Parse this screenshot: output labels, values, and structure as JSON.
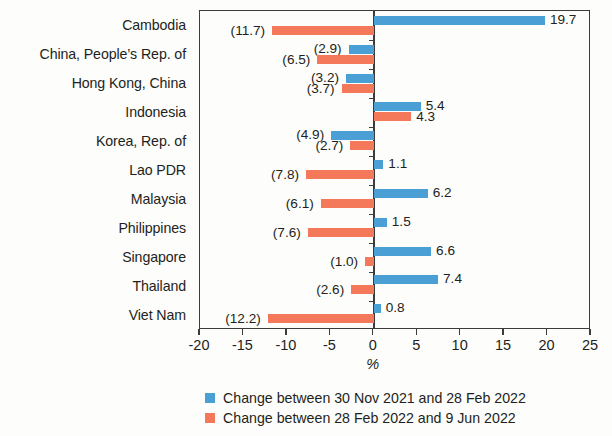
{
  "chart_data": {
    "type": "bar",
    "orientation": "horizontal",
    "title": "",
    "subtitle": "",
    "xlabel": "%",
    "ylabel": "",
    "xlim": [
      -20,
      25
    ],
    "xticks": [
      "-20",
      "-15",
      "-10",
      "-5",
      "0",
      "5",
      "10",
      "15",
      "20",
      "25"
    ],
    "xtick_values": [
      -20,
      -15,
      -10,
      -5,
      0,
      5,
      10,
      15,
      20,
      25
    ],
    "grid": false,
    "legend_position": "bottom",
    "negative_label_format": "parentheses",
    "categories": [
      "Cambodia",
      "China, People’s Rep. of",
      "Hong Kong, China",
      "Indonesia",
      "Korea, Rep. of",
      "Lao PDR",
      "Malaysia",
      "Philippines",
      "Singapore",
      "Thailand",
      "Viet Nam"
    ],
    "series": [
      {
        "name": "Change between 30 Nov 2021 and 28 Feb 2022",
        "color": "#4a9fd4",
        "values": [
          19.7,
          -2.9,
          -3.2,
          5.4,
          -4.9,
          1.1,
          6.2,
          1.5,
          6.6,
          7.4,
          0.8
        ],
        "labels": [
          "19.7",
          "(2.9)",
          "(3.2)",
          "5.4",
          "(4.9)",
          "1.1",
          "6.2",
          "1.5",
          "6.6",
          "7.4",
          "0.8"
        ]
      },
      {
        "name": "Change between 28 Feb 2022 and 9 Jun 2022",
        "color": "#f4795a",
        "values": [
          -11.7,
          -6.5,
          -3.7,
          4.3,
          -2.7,
          -7.8,
          -6.1,
          -7.6,
          -1.0,
          -2.6,
          -12.2
        ],
        "labels": [
          "(11.7)",
          "(6.5)",
          "(3.7)",
          "4.3",
          "(2.7)",
          "(7.8)",
          "(6.1)",
          "(7.6)",
          "(1.0)",
          "(2.6)",
          "(12.2)"
        ]
      }
    ]
  },
  "legend": {
    "items": [
      {
        "label": "Change between 30 Nov 2021 and 28 Feb 2022",
        "swatch": "blue"
      },
      {
        "label": "Change between 28 Feb 2022 and 9 Jun 2022",
        "swatch": "orange"
      }
    ]
  },
  "axis": {
    "x_title": "%"
  }
}
